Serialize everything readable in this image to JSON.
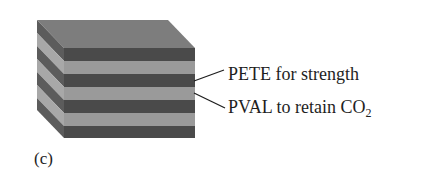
{
  "figure": {
    "panel_label": "(c)",
    "colors": {
      "top_face": "#7d7d7d",
      "dark_layer_front": "#4a4a4a",
      "light_layer_front": "#9a9a9a",
      "dark_layer_side": "#5c5c5c",
      "light_layer_side": "#a8a8a8",
      "leader_line": "#1e1e1e",
      "text": "#1e1e1e"
    },
    "layers_front": [
      "dark",
      "light",
      "dark",
      "light",
      "dark",
      "light",
      "dark"
    ],
    "labels": [
      {
        "id": "pete",
        "text": "PETE for strength",
        "points_to_layer": "dark"
      },
      {
        "id": "pval",
        "text_main": "PVAL to retain CO",
        "text_sub": "2",
        "points_to_layer": "light"
      }
    ]
  }
}
